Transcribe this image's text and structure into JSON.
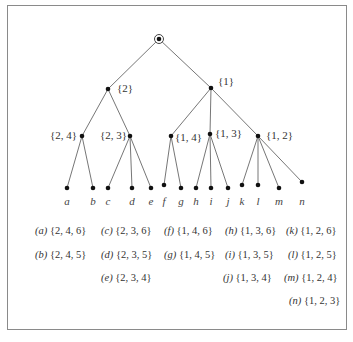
{
  "tree": {
    "root": {
      "label": "",
      "x": 159,
      "y": 39
    },
    "internal_nodes": [
      {
        "id": "n2",
        "label": "{2}",
        "x": 108,
        "y": 89,
        "lx": 117,
        "ly": 82,
        "parent": "root"
      },
      {
        "id": "n1",
        "label": "{1}",
        "x": 211,
        "y": 88,
        "lx": 218,
        "ly": 75,
        "parent": "root"
      },
      {
        "id": "n24",
        "label": "{2, 4}",
        "x": 82,
        "y": 136,
        "lx": 50,
        "ly": 129,
        "parent": "n2"
      },
      {
        "id": "n23",
        "label": "{2, 3}",
        "x": 130,
        "y": 136,
        "lx": 100,
        "ly": 129,
        "parent": "n2"
      },
      {
        "id": "n14",
        "label": "{1, 4}",
        "x": 171,
        "y": 136,
        "lx": 175,
        "ly": 131,
        "parent": "n1"
      },
      {
        "id": "n13",
        "label": "{1, 3}",
        "x": 210,
        "y": 134,
        "lx": 215,
        "ly": 127,
        "parent": "n1"
      },
      {
        "id": "n12",
        "label": "{1, 2}",
        "x": 258,
        "y": 136,
        "lx": 266,
        "ly": 129,
        "parent": "n1"
      }
    ],
    "leaves": [
      {
        "label": "a",
        "x": 67,
        "y": 188,
        "parent": "n24"
      },
      {
        "label": "b",
        "x": 93,
        "y": 188,
        "parent": "n24"
      },
      {
        "label": "c",
        "x": 108,
        "y": 188,
        "parent": "n23"
      },
      {
        "label": "d",
        "x": 132,
        "y": 188,
        "parent": "n23"
      },
      {
        "label": "e",
        "x": 151,
        "y": 188,
        "parent": "n23"
      },
      {
        "label": "f",
        "x": 164,
        "y": 185,
        "parent": "n14"
      },
      {
        "label": "g",
        "x": 181,
        "y": 188,
        "parent": "n14"
      },
      {
        "label": "h",
        "x": 196,
        "y": 188,
        "parent": "n13"
      },
      {
        "label": "i",
        "x": 211,
        "y": 188,
        "parent": "n13"
      },
      {
        "label": "j",
        "x": 228,
        "y": 188,
        "parent": "n13"
      },
      {
        "label": "k",
        "x": 242,
        "y": 185,
        "parent": "n12"
      },
      {
        "label": "l",
        "x": 258,
        "y": 185,
        "parent": "n12"
      },
      {
        "label": "m",
        "x": 279,
        "y": 188,
        "parent": "n12"
      },
      {
        "label": "n",
        "x": 302,
        "y": 182,
        "parent": "n12"
      }
    ]
  },
  "legend": [
    {
      "key": "(a)",
      "set": "{2, 4, 6}",
      "x": 35,
      "y": 225
    },
    {
      "key": "(c)",
      "set": "{2, 3, 6}",
      "x": 101,
      "y": 225
    },
    {
      "key": "(f)",
      "set": "{1, 4, 6}",
      "x": 164,
      "y": 225
    },
    {
      "key": "(h)",
      "set": "{1, 3, 6}",
      "x": 225,
      "y": 225
    },
    {
      "key": "(k)",
      "set": "{1, 2, 6}",
      "x": 286,
      "y": 225
    },
    {
      "key": "(b)",
      "set": "{2, 4, 5}",
      "x": 35,
      "y": 249
    },
    {
      "key": "(d)",
      "set": "{2, 3, 5}",
      "x": 101,
      "y": 249
    },
    {
      "key": "(g)",
      "set": "{1, 4, 5}",
      "x": 164,
      "y": 249
    },
    {
      "key": "(i)",
      "set": "{1, 3, 5}",
      "x": 225,
      "y": 249
    },
    {
      "key": "(l)",
      "set": "{1, 2, 5}",
      "x": 288,
      "y": 249
    },
    {
      "key": "(e)",
      "set": "{2, 3, 4}",
      "x": 101,
      "y": 272
    },
    {
      "key": "(j)",
      "set": "{1, 3, 4}",
      "x": 223,
      "y": 272
    },
    {
      "key": "(m)",
      "set": "{1, 2, 4}",
      "x": 284,
      "y": 272
    },
    {
      "key": "(n)",
      "set": "{1, 2, 3}",
      "x": 289,
      "y": 295
    }
  ]
}
